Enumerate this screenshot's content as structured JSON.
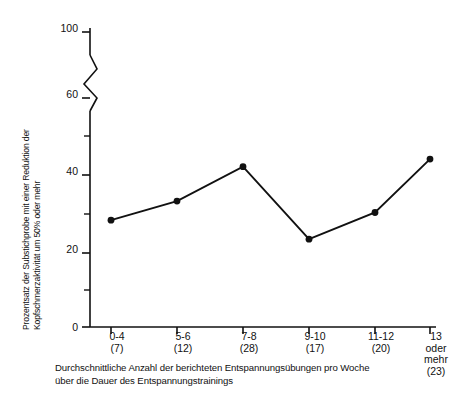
{
  "chart_data": {
    "type": "line",
    "title": "",
    "subtitle": "",
    "xlabel": "Durchschnittliche Anzahl der berichteten Entspannungsübungen pro Woche über die Dauer des Entspannungstrainings",
    "ylabel": "Prozentsatz der Substichprobe mit einer Reduktion der Kopfschmerzaktivität um 50% oder mehr",
    "categories": [
      "0-4",
      "5-6",
      "7-8",
      "9-10",
      "11-12",
      "13 oder mehr"
    ],
    "category_counts": [
      "(7)",
      "(12)",
      "(28)",
      "(17)",
      "(20)",
      "(23)"
    ],
    "values": [
      28,
      33,
      42,
      23,
      30,
      44
    ],
    "ylim": [
      0,
      100
    ],
    "yticks": [
      0,
      20,
      40,
      60,
      100
    ],
    "ytick_labels": [
      "0",
      "20",
      "40",
      "60",
      "100"
    ],
    "y_axis_break": {
      "between": [
        60,
        100
      ],
      "style": "zigzag"
    },
    "grid": false,
    "legend": false,
    "marker": "filled-circle",
    "line_color": "#111111",
    "marker_color": "#111111",
    "background": "#ffffff"
  },
  "axis": {
    "y_title_line1": "Prozentsatz der Substichprobe mit einer Reduktion der",
    "y_title_line2": "Kopfschmerzaktivität um 50% oder mehr"
  },
  "xaxis_items": [
    {
      "label": "0-4",
      "count": "(7)",
      "extra": ""
    },
    {
      "label": "5-6",
      "count": "(12)",
      "extra": ""
    },
    {
      "label": "7-8",
      "count": "(28)",
      "extra": ""
    },
    {
      "label": "9-10",
      "count": "(17)",
      "extra": ""
    },
    {
      "label": "11-12",
      "count": "(20)",
      "extra": ""
    },
    {
      "label": "13",
      "count": "(23)",
      "extra": "oder\nmehr"
    }
  ],
  "xaxis_item_6": {
    "label": "13",
    "extra_line1": "oder",
    "extra_line2": "mehr",
    "count": "(23)"
  },
  "caption": {
    "line1": "Durchschnittliche Anzahl der berichteten Entspannungsübungen pro Woche",
    "line2": "über die Dauer des Entspannungstrainings"
  },
  "ytick_labels": {
    "t0": "0",
    "t20": "20",
    "t40": "40",
    "t60": "60",
    "t100": "100"
  },
  "xtick_labels": {
    "c1": "0-4",
    "c2": "5-6",
    "c3": "7-8",
    "c4": "9-10",
    "c5": "11-12",
    "c6": "13"
  },
  "xtick_counts": {
    "n1": "(7)",
    "n2": "(12)",
    "n3": "(28)",
    "n4": "(17)",
    "n5": "(20)",
    "n6": "(23)"
  }
}
